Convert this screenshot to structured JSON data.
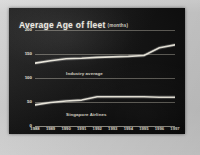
{
  "slide": {
    "title": "Average Age of fleet",
    "title_unit": "(months)",
    "background_color": "#121212",
    "text_color": "#f2efe6",
    "line_color": "#efece0",
    "grid_color": "#d7d2c4"
  },
  "chart_data": {
    "type": "line",
    "xlabel": "",
    "ylabel": "",
    "unit": "months",
    "grid": true,
    "legend_position": "inline-labels",
    "ylim": [
      0,
      200
    ],
    "yticks": [
      0,
      50,
      100,
      150,
      200
    ],
    "ytick_labels": [
      "0",
      "50",
      "100",
      "150",
      "200"
    ],
    "categories": [
      "1988",
      "1989",
      "1990",
      "1991",
      "1992",
      "1993",
      "1994",
      "1995",
      "1996",
      "1997"
    ],
    "series": [
      {
        "name": "Industry average",
        "color": "#efece0",
        "values": [
          131,
          136,
          140,
          141,
          143,
          144,
          145,
          147,
          163,
          169
        ]
      },
      {
        "name": "Singapore Airlines",
        "color": "#efece0",
        "values": [
          44,
          49,
          52,
          54,
          61,
          61,
          61,
          61,
          60,
          60
        ]
      }
    ],
    "annotations": [
      {
        "text": "Industry average",
        "x": "1990",
        "y": 112
      },
      {
        "text": "Singapore Airlines",
        "x": "1990",
        "y": 28
      }
    ]
  }
}
